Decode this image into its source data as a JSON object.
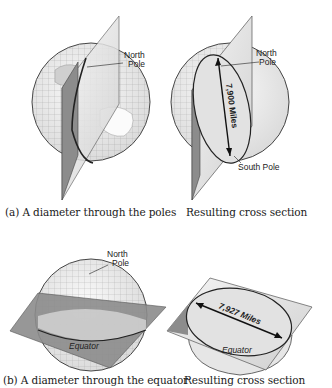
{
  "figure": {
    "panels": [
      {
        "id": "a-left",
        "caption": "(a) A diameter through the poles",
        "labels": {
          "north_pole_line1": "North",
          "north_pole_line2": "Pole"
        }
      },
      {
        "id": "a-right",
        "caption": "Resulting cross section",
        "labels": {
          "north_pole_line1": "North",
          "north_pole_line2": "Pole",
          "south_pole": "South Pole",
          "diameter": "7,900 Miles"
        }
      },
      {
        "id": "b-left",
        "caption": "(b) A diameter through the equator",
        "labels": {
          "north_pole_line1": "North",
          "north_pole_line2": "Pole",
          "equator": "Equator"
        }
      },
      {
        "id": "b-right",
        "caption": "Resulting cross section",
        "labels": {
          "equator": "Equator",
          "diameter": "7,927 Miles"
        }
      }
    ],
    "colors": {
      "plane_dark": "#8c8c8c",
      "plane_light": "#e4e4e4",
      "globe_fill": "#efefef",
      "section_fill": "#e2e2e2",
      "outline": "#333333"
    }
  }
}
